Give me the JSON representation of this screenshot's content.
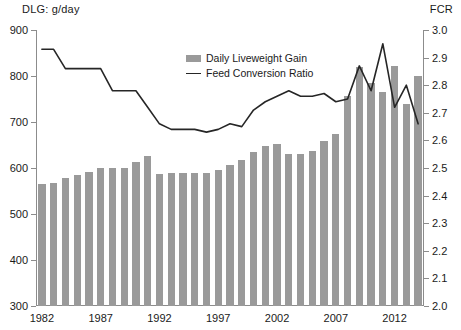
{
  "axes": {
    "left_caption": "DLG: g/day",
    "right_caption": "FCR"
  },
  "legend": {
    "items": [
      {
        "label": "Daily Liveweight Gain",
        "marker": "bar-swatch",
        "color": "#9a9a9a"
      },
      {
        "label": "Feed Conversion Ratio",
        "marker": "line-swatch",
        "color": "#262626"
      }
    ]
  },
  "chart_data": {
    "type": "bar",
    "title": "",
    "subtitle": "",
    "xlabel": "",
    "ylabel": "DLG: g/day",
    "y2label": "FCR",
    "ylim": [
      300,
      900
    ],
    "y2lim": [
      2.0,
      3.0
    ],
    "yticks": [
      300,
      400,
      500,
      600,
      700,
      800,
      900
    ],
    "ytick_labels": [
      "300",
      "400",
      "500",
      "600",
      "700",
      "800",
      "900"
    ],
    "y2ticks": [
      2.0,
      2.1,
      2.2,
      2.3,
      2.4,
      2.5,
      2.6,
      2.7,
      2.8,
      2.9,
      3.0
    ],
    "y2tick_labels": [
      "2.0",
      "2.1",
      "2.2",
      "2.3",
      "2.4",
      "2.5",
      "2.6",
      "2.7",
      "2.8",
      "2.9",
      "3.0"
    ],
    "grid": false,
    "legend_position": "inside-upper-center",
    "categories": [
      "1982",
      "1983",
      "1984",
      "1985",
      "1986",
      "1987",
      "1988",
      "1989",
      "1990",
      "1991",
      "1992",
      "1993",
      "1994",
      "1995",
      "1996",
      "1997",
      "1998",
      "1999",
      "2000",
      "2001",
      "2002",
      "2003",
      "2004",
      "2005",
      "2006",
      "2007",
      "2008",
      "2009",
      "2010",
      "2011",
      "2012",
      "2013",
      "2014"
    ],
    "xtick_labels": [
      "1982",
      "1987",
      "1992",
      "1997",
      "2002",
      "2007",
      "2012"
    ],
    "xtick_categories": [
      "1982",
      "1987",
      "1992",
      "1997",
      "2002",
      "2007",
      "2012"
    ],
    "series": [
      {
        "name": "Daily Liveweight Gain",
        "type": "bar",
        "axis": "left",
        "unit": "g/day",
        "color": "#9a9a9a",
        "values": [
          566,
          568,
          578,
          584,
          592,
          600,
          601,
          601,
          612,
          626,
          588,
          589,
          589,
          589,
          589,
          596,
          607,
          618,
          635,
          648,
          652,
          631,
          631,
          636,
          658,
          674,
          757,
          820,
          784,
          765,
          822,
          740,
          801
        ]
      },
      {
        "name": "Feed Conversion Ratio",
        "type": "line",
        "axis": "right",
        "unit": "",
        "color": "#262626",
        "values": [
          2.93,
          2.93,
          2.86,
          2.86,
          2.86,
          2.86,
          2.78,
          2.78,
          2.78,
          2.72,
          2.66,
          2.64,
          2.64,
          2.64,
          2.63,
          2.64,
          2.66,
          2.65,
          2.71,
          2.74,
          2.76,
          2.78,
          2.76,
          2.76,
          2.77,
          2.74,
          2.75,
          2.87,
          2.78,
          2.95,
          2.72,
          2.8,
          2.66
        ]
      }
    ]
  }
}
